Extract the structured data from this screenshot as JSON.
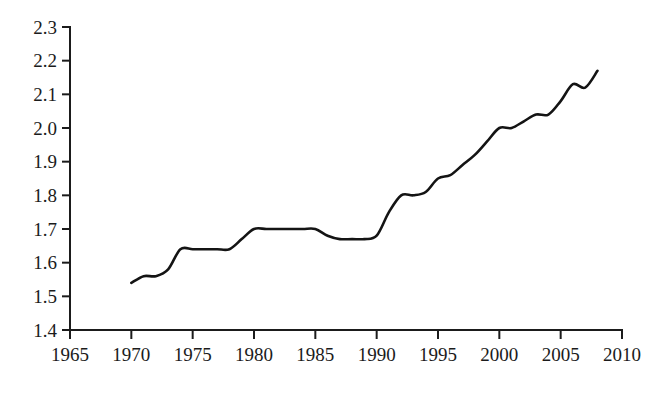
{
  "chart_data": {
    "type": "line",
    "title": "",
    "subtitle": "",
    "xlabel": "",
    "ylabel": "",
    "xlim": [
      1965,
      2010
    ],
    "ylim": [
      1.4,
      2.3
    ],
    "grid": false,
    "legend": null,
    "legend_position": "none",
    "x_ticks": [
      1965,
      1970,
      1975,
      1980,
      1985,
      1990,
      1995,
      2000,
      2005,
      2010
    ],
    "x_tick_labels": [
      "1965",
      "1970",
      "1975",
      "1980",
      "1985",
      "1990",
      "1995",
      "2000",
      "2005",
      "2010"
    ],
    "y_ticks": [
      1.4,
      1.5,
      1.6,
      1.7,
      1.8,
      1.9,
      2.0,
      2.1,
      2.2,
      2.3
    ],
    "y_tick_labels": [
      "1.4",
      "1.5",
      "1.6",
      "1.7",
      "1.8",
      "1.9",
      "2.0",
      "2.1",
      "2.2",
      "2.3"
    ],
    "series": [
      {
        "name": "series-1",
        "color": "#141414",
        "x": [
          1970,
          1971,
          1972,
          1973,
          1974,
          1975,
          1976,
          1977,
          1978,
          1979,
          1980,
          1981,
          1982,
          1983,
          1984,
          1985,
          1986,
          1987,
          1988,
          1989,
          1990,
          1991,
          1992,
          1993,
          1994,
          1995,
          1996,
          1997,
          1998,
          1999,
          2000,
          2001,
          2002,
          2003,
          2004,
          2005,
          2006,
          2007,
          2008
        ],
        "values": [
          1.54,
          1.56,
          1.56,
          1.58,
          1.64,
          1.64,
          1.64,
          1.64,
          1.64,
          1.67,
          1.7,
          1.7,
          1.7,
          1.7,
          1.7,
          1.7,
          1.68,
          1.67,
          1.67,
          1.67,
          1.68,
          1.75,
          1.8,
          1.8,
          1.81,
          1.85,
          1.86,
          1.89,
          1.92,
          1.96,
          2.0,
          2.0,
          2.02,
          2.04,
          2.04,
          2.08,
          2.13,
          2.12,
          2.17
        ]
      }
    ],
    "annotations": []
  },
  "axis": {
    "y_axis_name": "y-axis",
    "x_axis_name": "x-axis"
  }
}
